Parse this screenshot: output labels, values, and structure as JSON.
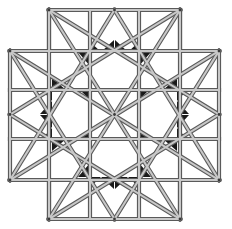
{
  "figure": {
    "title": "",
    "colors": {
      "background": "#ffffff",
      "bar_edge": "#5a5a5a",
      "bar_fill": "#c8c8c8",
      "triangle_fill": "#1a1a1a"
    }
  }
}
